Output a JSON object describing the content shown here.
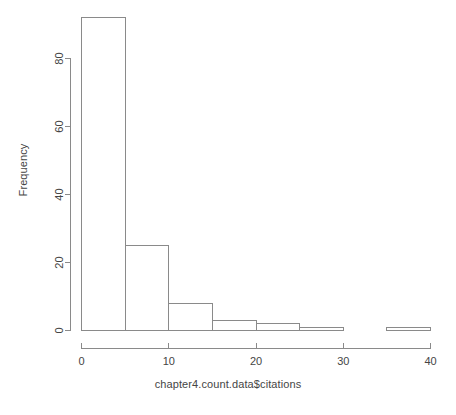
{
  "chart_data": {
    "type": "bar",
    "title": "",
    "subtitle": "",
    "xlabel": "chapter4.count.data$citations",
    "ylabel": "Frequency",
    "bin_width": 5,
    "bin_edges": [
      0,
      5,
      10,
      15,
      20,
      25,
      30,
      35,
      40
    ],
    "categories": [
      "0-5",
      "5-10",
      "10-15",
      "15-20",
      "20-25",
      "25-30",
      "30-35",
      "35-40"
    ],
    "values": [
      92,
      25,
      8,
      3,
      2,
      1,
      0,
      1
    ],
    "xlim": [
      0,
      40
    ],
    "ylim": [
      0,
      92
    ],
    "xticks": [
      0,
      10,
      20,
      30,
      40
    ],
    "xtick_labels": [
      "0",
      "10",
      "20",
      "30",
      "40"
    ],
    "yticks": [
      0,
      20,
      40,
      60,
      80
    ],
    "ytick_labels": [
      "0",
      "20",
      "40",
      "60",
      "80"
    ],
    "grid": false,
    "legend": false,
    "bar_fill_color": "#ffffff",
    "bar_border_color": "#8a8a8a",
    "axis_color": "#8a8a8a",
    "background_color": "#ffffff"
  },
  "figure": {
    "x_axis_label": "chapter4.count.data$citations",
    "y_axis_label": "Frequency"
  }
}
